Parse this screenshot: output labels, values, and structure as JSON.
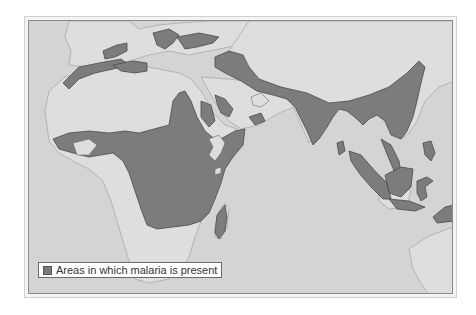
{
  "map": {
    "title": "Malaria distribution map",
    "colors": {
      "ocean": "#d4d4d4",
      "land": "#dedede",
      "land_outline": "#a8a8a8",
      "malaria": "#7c7c7c",
      "malaria_outline": "#4a4a4a"
    },
    "legend": {
      "label": "Areas in which malaria is present",
      "swatch_color": "#7a7a7a"
    }
  }
}
